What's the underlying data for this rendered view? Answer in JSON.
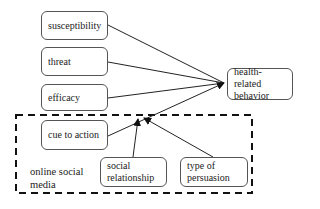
{
  "diagram": {
    "nodes": {
      "susceptibility": "susceptibility",
      "threat": "threat",
      "efficacy": "efficacy",
      "cue_to_action": "cue to action",
      "health_behavior_line1": "health-related",
      "health_behavior_line2": "behavior",
      "social_relationship_line1": "social",
      "social_relationship_line2": "relationship",
      "type_of_persuasion_line1": "type of",
      "type_of_persuasion_line2": "persuasion"
    },
    "group": {
      "label_line1": "online social",
      "label_line2": "media",
      "style": "dashed"
    },
    "edges": [
      {
        "from": "susceptibility",
        "to": "health-related behavior"
      },
      {
        "from": "threat",
        "to": "health-related behavior"
      },
      {
        "from": "efficacy",
        "to": "health-related behavior"
      },
      {
        "from": "cue to action",
        "to": "health-related behavior"
      },
      {
        "from": "social relationship",
        "to": "cue to action → health-related behavior (moderation)"
      },
      {
        "from": "type of persuasion",
        "to": "cue to action → health-related behavior (moderation)"
      }
    ]
  }
}
